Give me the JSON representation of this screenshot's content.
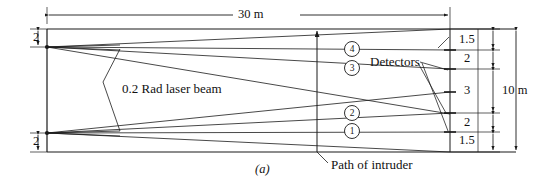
{
  "figure": {
    "caption": "(a)"
  },
  "dimensions": {
    "length_top": "30 m",
    "height_right": "10 m",
    "left_top_gap": "2",
    "left_bottom_gap": "2",
    "right_segments": [
      "1.5",
      "2",
      "3",
      "2",
      "1.5"
    ]
  },
  "annotations": {
    "laser_beam": "0.2 Rad laser beam",
    "detectors": "Detectors",
    "intruder_path": "Path of intruder"
  },
  "beam_markers": [
    {
      "id": "1",
      "label": "1"
    },
    {
      "id": "2",
      "label": "2"
    },
    {
      "id": "3",
      "label": "3"
    },
    {
      "id": "4",
      "label": "4"
    }
  ],
  "colors": {
    "line": "#1a1a1a",
    "background": "#ffffff"
  }
}
